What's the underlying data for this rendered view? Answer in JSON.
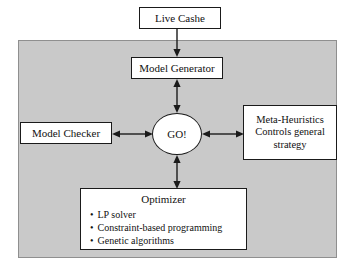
{
  "diagram": {
    "panel": {
      "name": "system-boundary",
      "fill": "#c9c9c9",
      "border": "#8f8f8f"
    },
    "nodes": {
      "live_cashe": {
        "label": "Live Cashe"
      },
      "model_generator": {
        "label": "Model Generator"
      },
      "model_checker": {
        "label": "Model Checker"
      },
      "go": {
        "label": "GO!"
      },
      "meta_heuristics": {
        "line1": "Meta-Heuristics",
        "line2": "Controls general",
        "line3": "strategy"
      },
      "optimizer": {
        "title": "Optimizer",
        "items": [
          "LP solver",
          "Constraint-based programming",
          "Genetic algorithms"
        ]
      }
    },
    "connectors": [
      {
        "name": "live-cashe-to-model-generator",
        "from": "Live Cashe",
        "to": "Model Generator",
        "direction": "down"
      },
      {
        "name": "model-generator-to-go",
        "from": "Model Generator",
        "to": "GO!",
        "direction": "bidirectional-vertical"
      },
      {
        "name": "model-checker-to-go",
        "from": "Model Checker",
        "to": "GO!",
        "direction": "bidirectional-horizontal"
      },
      {
        "name": "go-to-meta-heuristics",
        "from": "GO!",
        "to": "Meta-Heuristics",
        "direction": "bidirectional-horizontal"
      },
      {
        "name": "go-to-optimizer",
        "from": "GO!",
        "to": "Optimizer",
        "direction": "bidirectional-vertical"
      }
    ],
    "colors": {
      "stroke": "#1a1a1a",
      "box_fill": "#ffffff",
      "panel_fill": "#c9c9c9",
      "page": "#ffffff"
    }
  }
}
